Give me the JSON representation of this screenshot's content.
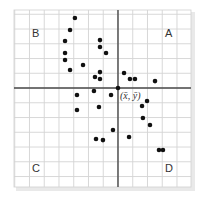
{
  "chart_data": {
    "type": "scatter",
    "title": "",
    "xlabel": "",
    "ylabel": "",
    "grid": true,
    "legend": null,
    "xlim": [
      -7.05,
      4.95
    ],
    "ylim": [
      -6.71,
      5.29
    ],
    "grid_step": 1,
    "center_point": {
      "label": "(x̄, ȳ)",
      "x": 0,
      "y": 0
    },
    "quadrant_labels": [
      {
        "label": "A",
        "position": "top-right"
      },
      {
        "label": "B",
        "position": "top-left"
      },
      {
        "label": "C",
        "position": "bottom-left"
      },
      {
        "label": "D",
        "position": "bottom-right"
      }
    ],
    "series": [
      {
        "name": "data",
        "points": [
          [
            -2.92,
            4.75
          ],
          [
            -3.25,
            3.93
          ],
          [
            -3.59,
            3.19
          ],
          [
            -3.59,
            2.37
          ],
          [
            -3.59,
            1.9
          ],
          [
            -3.25,
            1.22
          ],
          [
            -2.37,
            1.56
          ],
          [
            -1.22,
            3.25
          ],
          [
            -1.22,
            2.78
          ],
          [
            -0.81,
            2.37
          ],
          [
            -1.22,
            1.08
          ],
          [
            -1.56,
            0.75
          ],
          [
            -1.22,
            0.61
          ],
          [
            -1.63,
            -0.2
          ],
          [
            -2.78,
            -0.47
          ],
          [
            -0.47,
            -0.47
          ],
          [
            -2.78,
            -1.49
          ],
          [
            -1.29,
            -1.29
          ],
          [
            -0.34,
            -2.85
          ],
          [
            -1.49,
            -3.46
          ],
          [
            -1.02,
            -3.53
          ],
          [
            0.41,
            1.02
          ],
          [
            0.81,
            0.61
          ],
          [
            1.15,
            0.61
          ],
          [
            2.51,
            0.47
          ],
          [
            1.97,
            -0.88
          ],
          [
            1.63,
            -1.22
          ],
          [
            1.69,
            -2.03
          ],
          [
            2.17,
            -2.51
          ],
          [
            0.75,
            -3.32
          ],
          [
            2.78,
            -4.2
          ],
          [
            3.05,
            -4.2
          ]
        ]
      }
    ]
  },
  "colors": {
    "grid": "#d4d4d4",
    "axis": "#4a4a4a",
    "point": "#111111",
    "text": "#333333"
  }
}
